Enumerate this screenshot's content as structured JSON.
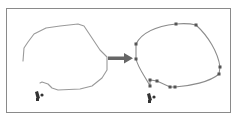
{
  "diagram": {
    "colors": {
      "frame": "#8a8a8a",
      "stroke": "#8c8c8c",
      "anchor": "#555555",
      "arrow": "#666666",
      "cursor": "#333333"
    },
    "left_panel": {
      "label": "",
      "path_type": "freehand"
    },
    "right_panel": {
      "label": "",
      "path_type": "anchored",
      "anchors": [
        [
          176,
          24
        ],
        [
          196,
          25
        ],
        [
          136,
          44
        ],
        [
          136,
          59
        ],
        [
          220,
          67
        ],
        [
          219,
          74
        ],
        [
          150,
          80
        ],
        [
          157,
          81
        ],
        [
          150,
          86
        ],
        [
          170,
          87
        ],
        [
          175,
          87
        ]
      ]
    },
    "arrow": {
      "from": [
        109,
        58
      ],
      "to": [
        132,
        58
      ]
    }
  }
}
